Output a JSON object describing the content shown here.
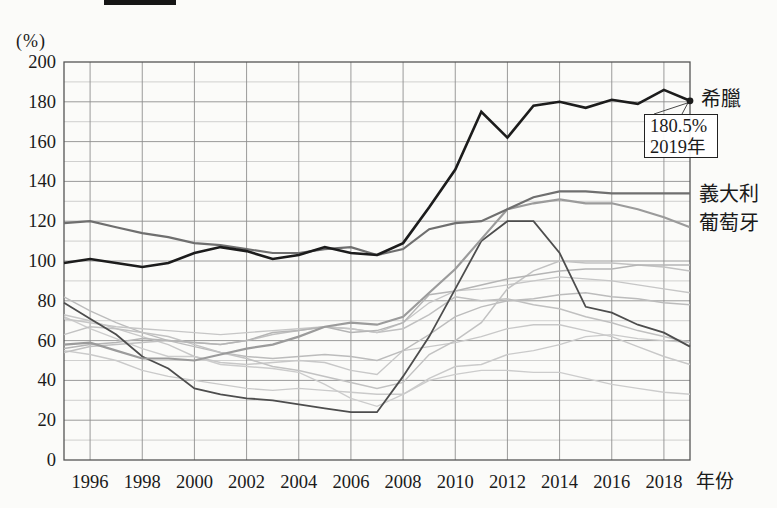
{
  "page": {
    "background": "#fbfbf9"
  },
  "banner_fragment": {
    "description": "cropped-black-bar-top-edge",
    "color": "#161616"
  },
  "chart_data": {
    "type": "line",
    "title": "",
    "unit_label": "(%)",
    "xlabel": "年份",
    "ylabel": "",
    "ylim": [
      0,
      200
    ],
    "y_ticks": [
      0,
      20,
      40,
      60,
      80,
      100,
      120,
      140,
      160,
      180,
      200
    ],
    "x_tick_years": [
      1996,
      1998,
      2000,
      2002,
      2004,
      2006,
      2008,
      2010,
      2012,
      2014,
      2016,
      2018
    ],
    "x_years": [
      1995,
      1996,
      1997,
      1998,
      1999,
      2000,
      2001,
      2002,
      2003,
      2004,
      2005,
      2006,
      2007,
      2008,
      2009,
      2010,
      2011,
      2012,
      2013,
      2014,
      2015,
      2016,
      2017,
      2018,
      2019
    ],
    "grid": {
      "horizontal_step": 10,
      "vertical_step_years": 2,
      "major_color": "#8f8f8f",
      "minor_color": "#bdbdbd",
      "border_color": "#555555",
      "grid_on": true
    },
    "plot": {
      "left": 64,
      "top": 62,
      "right": 690,
      "bottom": 460
    },
    "legend_position": "right-edge-inline-labels",
    "series": [
      {
        "name": "希臘",
        "color": "#1c1c1c",
        "width": 2.6,
        "endpoint_dot": true,
        "values": [
          99,
          101,
          99,
          97,
          99,
          104,
          107,
          105,
          101,
          103,
          107,
          104,
          103,
          109,
          127,
          146,
          175,
          162,
          178,
          180,
          177,
          181,
          179,
          186,
          180.5
        ]
      },
      {
        "name": "義大利",
        "color": "#6f6f6f",
        "width": 2.2,
        "values": [
          119,
          120,
          117,
          114,
          112,
          109,
          108,
          106,
          104,
          104,
          106,
          107,
          103,
          106,
          116,
          119,
          120,
          126,
          132,
          135,
          135,
          134,
          134,
          134,
          134
        ]
      },
      {
        "name": "葡萄牙",
        "color": "#9b9b9b",
        "width": 2.2,
        "values": [
          58,
          59,
          55,
          51,
          51,
          50,
          53,
          56,
          58,
          62,
          67,
          69,
          68,
          72,
          84,
          96,
          111,
          126,
          129,
          131,
          129,
          129,
          126,
          122,
          117
        ]
      },
      {
        "name": "",
        "color": "#4d4d4d",
        "width": 1.8,
        "values": [
          79,
          71,
          63,
          52,
          46,
          36,
          33,
          31,
          30,
          28,
          26,
          24,
          24,
          42,
          62,
          86,
          110,
          120,
          120,
          104,
          77,
          74,
          68,
          64,
          57
        ]
      },
      {
        "name": "",
        "color": "#b5b5b5",
        "width": 1.5,
        "values": [
          56,
          58,
          59,
          61,
          60,
          59,
          58,
          60,
          64,
          65,
          67,
          64,
          65,
          69,
          83,
          85,
          88,
          91,
          93,
          95,
          96,
          96,
          98,
          98,
          98
        ]
      },
      {
        "name": "",
        "color": "#c2c2c2",
        "width": 1.5,
        "values": [
          63,
          67,
          66,
          64,
          62,
          58,
          54,
          51,
          47,
          45,
          42,
          39,
          36,
          39,
          53,
          60,
          69,
          86,
          95,
          100,
          99,
          99,
          98,
          97,
          95
        ]
      },
      {
        "name": "",
        "color": "#c6c6c6",
        "width": 1.4,
        "values": [
          71,
          69,
          67,
          66,
          65,
          64,
          63,
          64,
          65,
          66,
          67,
          66,
          64,
          69,
          79,
          85,
          86,
          88,
          90,
          92,
          91,
          90,
          88,
          86,
          84
        ]
      },
      {
        "name": "",
        "color": "#bcbcbc",
        "width": 1.4,
        "values": [
          82,
          75,
          69,
          64,
          60,
          57,
          54,
          52,
          51,
          52,
          53,
          52,
          50,
          55,
          63,
          72,
          77,
          80,
          81,
          83,
          84,
          82,
          81,
          79,
          78
        ]
      },
      {
        "name": "",
        "color": "#c0c0c0",
        "width": 1.5,
        "values": [
          54,
          57,
          58,
          59,
          60,
          59,
          58,
          60,
          63,
          65,
          67,
          66,
          64,
          66,
          73,
          82,
          80,
          81,
          78,
          76,
          72,
          69,
          65,
          62,
          59
        ]
      },
      {
        "name": "",
        "color": "#cacaca",
        "width": 1.4,
        "values": [
          55,
          53,
          50,
          45,
          42,
          40,
          38,
          36,
          35,
          36,
          35,
          34,
          33,
          33,
          41,
          47,
          48,
          53,
          55,
          58,
          62,
          63,
          61,
          60,
          59
        ]
      },
      {
        "name": "",
        "color": "#c8c8c8",
        "width": 1.4,
        "values": [
          73,
          70,
          66,
          62,
          58,
          52,
          49,
          48,
          49,
          50,
          49,
          45,
          43,
          55,
          57,
          59,
          62,
          66,
          68,
          68,
          65,
          62,
          57,
          52,
          48
        ]
      },
      {
        "name": "",
        "color": "#cccccc",
        "width": 1.4,
        "values": [
          72,
          66,
          61,
          56,
          52,
          52,
          48,
          47,
          46,
          44,
          38,
          31,
          27,
          33,
          40,
          43,
          45,
          45,
          44,
          44,
          41,
          38,
          36,
          34,
          33
        ]
      }
    ],
    "annotation": {
      "value_label": "180.5%",
      "year_label": "2019年",
      "x_year": 2019,
      "y_value": 180.5,
      "leader_color": "#333333"
    }
  }
}
